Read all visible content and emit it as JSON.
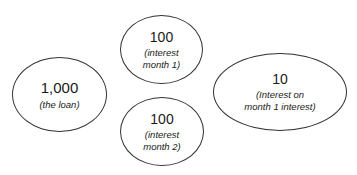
{
  "diagram": {
    "nodes": [
      {
        "id": "loan",
        "value": "1,000",
        "caption_lines": [
          "(the loan)"
        ]
      },
      {
        "id": "interest-month-1",
        "value": "100",
        "caption_lines": [
          "(interest",
          "month 1)"
        ]
      },
      {
        "id": "interest-month-2",
        "value": "100",
        "caption_lines": [
          "(interest",
          "month 2)"
        ]
      },
      {
        "id": "interest-on-interest",
        "value": "10",
        "caption_lines": [
          "(Interest on",
          "month 1 interest)"
        ]
      }
    ],
    "colors": {
      "stroke": "#333333",
      "text": "#1a1a1a",
      "background": "#ffffff"
    }
  }
}
